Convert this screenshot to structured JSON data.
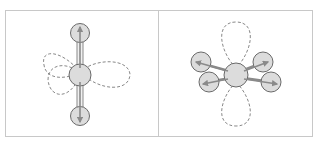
{
  "figure": {
    "panels": [
      {
        "id": "left",
        "description": "Linear molecule with three atoms along the vertical axis; dashed orbital lobes crossing the central atom",
        "atoms": 3,
        "orbital_lobes": 4
      },
      {
        "id": "right",
        "description": "Central atom with four peripheral atoms in a planar arrangement; dashed orbital lobes above and below",
        "atoms": 5,
        "orbital_lobes": 2
      }
    ],
    "colors": {
      "frame": "#c8c8c8",
      "atom_fill": "#dcdcdc",
      "atom_stroke": "#6a6a6a",
      "arrow": "#8a8a8a",
      "lobe": "#7a7a7a"
    }
  }
}
